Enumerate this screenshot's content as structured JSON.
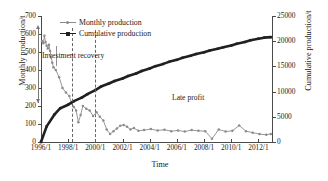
{
  "chart_data": {
    "type": "line",
    "title": "",
    "xlabel": "Time",
    "ylabel": "Monthly production/t",
    "y2label": "Cumulative production/t",
    "ylim": [
      0,
      700
    ],
    "y2lim": [
      0,
      25000
    ],
    "xlim": [
      "1996/1",
      "2012/12"
    ],
    "grid": false,
    "legend_position": "top-left-inside",
    "y_ticks": [
      "0",
      "100",
      "200",
      "300",
      "400",
      "500",
      "600",
      "700"
    ],
    "y2_ticks": [
      "0",
      "5000",
      "10000",
      "15000",
      "20000",
      "25000"
    ],
    "x_ticks": [
      "1996/1",
      "1998/1",
      "2000/1",
      "2002/1",
      "2004/1",
      "2006/1",
      "2008/1",
      "2010/1",
      "2012/1"
    ],
    "annotations": [
      {
        "text": "Investment recovery",
        "x": "1997/6",
        "y": 430
      },
      {
        "text": "Late profit",
        "x": "2007/6",
        "y": 215
      }
    ],
    "reference_lines": [
      {
        "type": "vertical-dashed",
        "x": "1999/1",
        "label": ""
      }
    ],
    "series": [
      {
        "name": "Monthly production",
        "axis": "left",
        "color": "#8c8c8c",
        "marker": "circle",
        "x": [
          "1996/2",
          "1996/3",
          "1996/4",
          "1996/5",
          "1996/6",
          "1996/7",
          "1996/8",
          "1996/9",
          "1996/10",
          "1996/11",
          "1996/12",
          "1997/2",
          "1997/5",
          "1997/8",
          "1997/11",
          "1998/2",
          "1998/4",
          "1998/6",
          "1998/8",
          "1998/10",
          "1998/12",
          "1999/2",
          "1999/5",
          "1999/8",
          "1999/11",
          "2000/2",
          "2000/5",
          "2000/8",
          "2000/11",
          "2001/2",
          "2001/5",
          "2001/8",
          "2001/11",
          "2002/2",
          "2002/5",
          "2002/8",
          "2002/11",
          "2003/3",
          "2003/8",
          "2004/2",
          "2004/8",
          "2005/2",
          "2005/8",
          "2006/2",
          "2006/8",
          "2007/2",
          "2007/8",
          "2008/2",
          "2008/8",
          "2009/2",
          "2009/8",
          "2010/2",
          "2010/8",
          "2011/2",
          "2011/8",
          "2012/2",
          "2012/8",
          "2012/12"
        ],
        "values": [
          560,
          548,
          590,
          555,
          535,
          520,
          540,
          505,
          470,
          440,
          415,
          400,
          360,
          300,
          275,
          255,
          215,
          195,
          175,
          110,
          150,
          200,
          185,
          175,
          145,
          165,
          140,
          120,
          70,
          45,
          60,
          75,
          90,
          95,
          85,
          70,
          78,
          62,
          66,
          72,
          64,
          68,
          60,
          64,
          58,
          66,
          62,
          60,
          18,
          70,
          58,
          62,
          92,
          60,
          52,
          44,
          40,
          45
        ]
      },
      {
        "name": "Cumulative production",
        "axis": "right",
        "color": "#202020",
        "marker": "square",
        "x": [
          "1996/1",
          "1996/6",
          "1997/1",
          "1997/6",
          "1998/1",
          "1998/6",
          "1999/1",
          "1999/6",
          "2000/1",
          "2000/6",
          "2001/1",
          "2001/6",
          "2002/1",
          "2002/6",
          "2003/1",
          "2003/6",
          "2004/1",
          "2004/6",
          "2005/1",
          "2005/6",
          "2006/1",
          "2006/6",
          "2007/1",
          "2007/6",
          "2008/1",
          "2008/6",
          "2009/1",
          "2009/6",
          "2010/1",
          "2010/6",
          "2011/1",
          "2011/6",
          "2012/1",
          "2012/6",
          "2012/12"
        ],
        "values": [
          0,
          3100,
          5500,
          6700,
          7400,
          8100,
          8800,
          9500,
          10300,
          11000,
          11600,
          12100,
          12600,
          13100,
          13600,
          14100,
          14600,
          15050,
          15500,
          15900,
          16300,
          16700,
          17100,
          17450,
          17800,
          18150,
          18500,
          18800,
          19150,
          19500,
          19850,
          20200,
          20500,
          20700,
          20800
        ]
      }
    ]
  },
  "legend": {
    "items": [
      {
        "label": "Monthly production",
        "color": "#8c8c8c"
      },
      {
        "label": "Cumulative production",
        "color": "#202020"
      }
    ]
  },
  "axes": {
    "left": {
      "title": "Monthly production/t"
    },
    "right": {
      "title": "Cumulative production/t"
    },
    "bottom": {
      "title": "Time"
    }
  },
  "annotations": {
    "investment_recovery": "Investment recovery",
    "late_profit": "Late profit"
  },
  "colors": {
    "monthly": "#8c8c8c",
    "cumulative": "#202020",
    "axis": "#4a4a4a",
    "dashed": "#666666",
    "background": "#ffffff"
  }
}
